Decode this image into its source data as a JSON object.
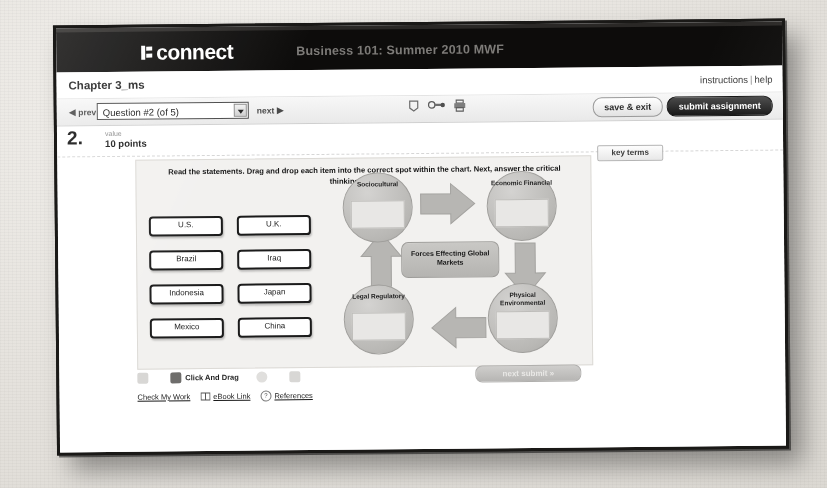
{
  "app": {
    "brand": "connect",
    "course_title": "Business 101: Summer 2010 MWF"
  },
  "chapter": {
    "title": "Chapter 3_ms",
    "instructions_link": "instructions",
    "help_link": "help",
    "separator": "|"
  },
  "toolbar": {
    "prev_label": "prev",
    "next_label": "next",
    "question_select_value": "Question #2 (of 5)",
    "save_exit_label": "save & exit",
    "submit_assignment_label": "submit assignment",
    "icons": [
      "bookmark-icon",
      "reference-link-icon",
      "printer-icon"
    ]
  },
  "question": {
    "number": "2.",
    "value_label": "value",
    "points": "10 points",
    "key_terms_label": "key terms",
    "instructions": "Read the statements.  Drag and drop each item into the correct spot within the chart. Next, answer the critical thinking questions."
  },
  "tiles": {
    "column_1": [
      "U.S.",
      "Brazil",
      "Indonesia",
      "Mexico"
    ],
    "column_2": [
      "U.K.",
      "Iraq",
      "Japan",
      "China"
    ]
  },
  "diagram": {
    "center_label": "Forces Effecting Global Markets",
    "nodes": [
      {
        "id": "sociocultural",
        "label": "Sociocultural",
        "drop_value": ""
      },
      {
        "id": "economic-financial",
        "label": "Economic Financial",
        "drop_value": ""
      },
      {
        "id": "legal-regulatory",
        "label": "Legal Regulatory",
        "drop_value": ""
      },
      {
        "id": "physical-environmental",
        "label": "Physical Environmental",
        "drop_value": ""
      }
    ]
  },
  "exercise_tools": {
    "item_1": "",
    "click_and_drag": "Click And Drag",
    "item_3": "",
    "item_4": "",
    "next_submit_label": "next  submit »"
  },
  "bottom_links": {
    "check_my_work": "Check My Work",
    "ebook_link": "eBook Link",
    "references": "References",
    "ref_badge": "?"
  }
}
